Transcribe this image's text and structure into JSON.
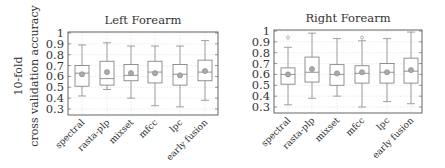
{
  "y_axis_label": {
    "line1": "10-fold",
    "line2": "cross validation accuracy"
  },
  "colors": {
    "box": "#777777",
    "whisker": "#888888",
    "grid": "#dddddd",
    "frame": "#555555",
    "mean": "#999999"
  },
  "chart_data": [
    {
      "type": "boxplot",
      "title": "Left Forearm",
      "xlabel": "",
      "ylabel": "10-fold cross validation accuracy",
      "ylim": [
        0.25,
        1.0
      ],
      "yticks": [
        0.3,
        0.4,
        0.5,
        0.6,
        0.7,
        0.8,
        0.9,
        1
      ],
      "ytick_labels": [
        "0.3",
        "0.4",
        "0.5",
        "0.6",
        "0.7",
        "0.8",
        "0.9",
        "1"
      ],
      "grid": true,
      "categories": [
        "spectral",
        "rasta-plp",
        "mixset",
        "mfcc",
        "lpc",
        "early fusion"
      ],
      "series": [
        {
          "name": "spectral",
          "whisker_low": 0.42,
          "q1": 0.51,
          "median": 0.63,
          "q3": 0.7,
          "whisker_high": 0.89,
          "mean": 0.62,
          "outliers": []
        },
        {
          "name": "rasta-plp",
          "whisker_low": 0.48,
          "q1": 0.52,
          "median": 0.58,
          "q3": 0.74,
          "whisker_high": 0.91,
          "mean": 0.64,
          "outliers": []
        },
        {
          "name": "mixset",
          "whisker_low": 0.4,
          "q1": 0.56,
          "median": 0.61,
          "q3": 0.71,
          "whisker_high": 0.88,
          "mean": 0.63,
          "outliers": []
        },
        {
          "name": "mfcc",
          "whisker_low": 0.33,
          "q1": 0.54,
          "median": 0.64,
          "q3": 0.74,
          "whisker_high": 0.88,
          "mean": 0.63,
          "outliers": []
        },
        {
          "name": "lpc",
          "whisker_low": 0.32,
          "q1": 0.52,
          "median": 0.62,
          "q3": 0.71,
          "whisker_high": 0.88,
          "mean": 0.61,
          "outliers": []
        },
        {
          "name": "early fusion",
          "whisker_low": 0.38,
          "q1": 0.56,
          "median": 0.64,
          "q3": 0.75,
          "whisker_high": 0.93,
          "mean": 0.65,
          "outliers": []
        }
      ]
    },
    {
      "type": "boxplot",
      "title": "Right Forearm",
      "xlabel": "",
      "ylabel": "",
      "ylim": [
        0.25,
        1.0
      ],
      "yticks": [
        0.3,
        0.4,
        0.5,
        0.6,
        0.7,
        0.8,
        0.9,
        1
      ],
      "ytick_labels": [
        "0.3",
        "0.4",
        "0.5",
        "0.6",
        "0.7",
        "0.8",
        "0.9",
        "1"
      ],
      "grid": true,
      "categories": [
        "spectral",
        "rasta-plp",
        "mixset",
        "mfcc",
        "lpc",
        "early fusion"
      ],
      "series": [
        {
          "name": "spectral",
          "whisker_low": 0.32,
          "q1": 0.51,
          "median": 0.6,
          "q3": 0.66,
          "whisker_high": 0.85,
          "mean": 0.6,
          "outliers": [
            0.94
          ]
        },
        {
          "name": "rasta-plp",
          "whisker_low": 0.38,
          "q1": 0.53,
          "median": 0.62,
          "q3": 0.76,
          "whisker_high": 0.98,
          "mean": 0.65,
          "outliers": []
        },
        {
          "name": "mixset",
          "whisker_low": 0.4,
          "q1": 0.5,
          "median": 0.6,
          "q3": 0.69,
          "whisker_high": 0.93,
          "mean": 0.61,
          "outliers": []
        },
        {
          "name": "mfcc",
          "whisker_low": 0.3,
          "q1": 0.52,
          "median": 0.61,
          "q3": 0.68,
          "whisker_high": 0.91,
          "mean": 0.62,
          "outliers": [
            0.94
          ]
        },
        {
          "name": "lpc",
          "whisker_low": 0.35,
          "q1": 0.52,
          "median": 0.62,
          "q3": 0.7,
          "whisker_high": 0.93,
          "mean": 0.62,
          "outliers": []
        },
        {
          "name": "early fusion",
          "whisker_low": 0.33,
          "q1": 0.52,
          "median": 0.63,
          "q3": 0.75,
          "whisker_high": 0.99,
          "mean": 0.64,
          "outliers": []
        }
      ]
    }
  ]
}
